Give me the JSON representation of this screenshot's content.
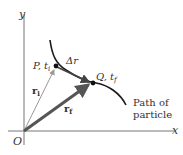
{
  "diagram": {
    "axes": {
      "x_label": "x",
      "y_label": "y",
      "origin_label": "O"
    },
    "points": {
      "P": {
        "label": "P, t",
        "sub": "i"
      },
      "Q": {
        "label": "Q, t",
        "sub": "f"
      }
    },
    "vectors": {
      "ri": {
        "label": "r",
        "sub": "i"
      },
      "rf": {
        "label": "r",
        "sub": "f"
      },
      "delta_r": {
        "label": "Δr"
      }
    },
    "path_label": {
      "line1": "Path of",
      "line2": "particle"
    },
    "colors": {
      "axis": "#555555",
      "curve": "#1a1a1a",
      "ri": "#999999",
      "rf": "#555555",
      "delta": "#444444",
      "text": "#333333"
    }
  }
}
